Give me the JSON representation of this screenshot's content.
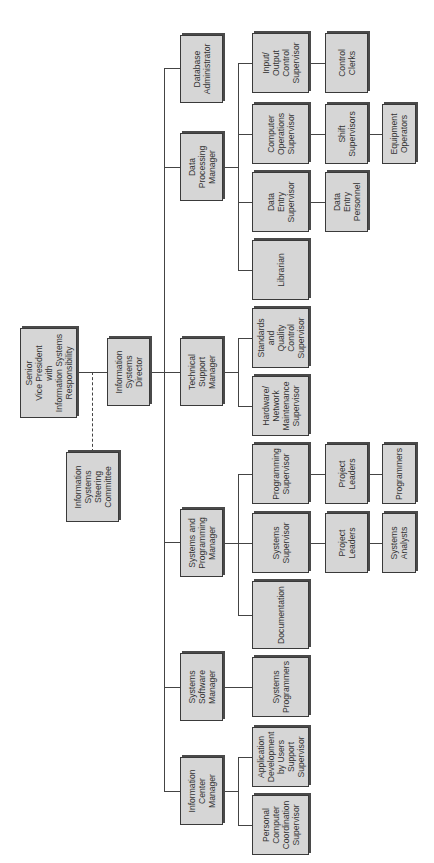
{
  "diagram": {
    "type": "org-chart",
    "orientation": "rotated-90-ccw",
    "colors": {
      "box_fill": "#d6d6d6",
      "box_border": "#3a3a3a",
      "shadow": "#4a4a4a",
      "line": "#444444"
    },
    "nodes": {
      "svp": "Senior\nVice President\nwith\nInformation Systems\nResponsibility",
      "steering": "Information\nSystems\nSteering\nCommittee",
      "director": "Information\nSystems\nDirector",
      "dba": "Database\nAdministrator",
      "dpm": "Data\nProcessing\nManager",
      "io_sup": "Input/\nOutput\nControl\nSupervisor",
      "control_clerks": "Control\nClerks",
      "comp_ops": "Computer\nOperations\nSupervisor",
      "shift_sup": "Shift\nSupervisors",
      "equip_ops": "Equipment\nOperators",
      "data_entry_sup": "Data\nEntry\nSupervisor",
      "data_entry_pers": "Data\nEntry\nPersonnel",
      "librarian": "Librarian",
      "tsm": "Technical\nSupport\nManager",
      "standards": "Standards\nand\nQuality\nControl\nSupervisor",
      "hardware": "Hardware/\nNetwork\nMaintenance\nSupervisor",
      "spm": "Systems and\nProgramming\nManager",
      "prog_sup": "Programming\nSupervisor",
      "proj_leaders_1": "Project\nLeaders",
      "programmers": "Programmers",
      "sys_sup": "Systems\nSupervisor",
      "proj_leaders_2": "Project\nLeaders",
      "sys_analysts": "Systems\nAnalysts",
      "documentation": "Documentation",
      "ssm": "Systems\nSoftware\nManager",
      "sys_programmers": "Systems\nProgrammers",
      "icm": "Information\nCenter\nManager",
      "app_dev": "Application\nDevelopment\nby Users\nSupport\nSupervisor",
      "pc_coord": "Personal\nComputer\nCoordination\nSupervisor"
    },
    "edges": [
      [
        "svp",
        "director"
      ],
      [
        "svp",
        "steering",
        "dashed"
      ],
      [
        "director",
        "dba"
      ],
      [
        "director",
        "dpm"
      ],
      [
        "director",
        "tsm"
      ],
      [
        "director",
        "spm"
      ],
      [
        "director",
        "ssm"
      ],
      [
        "director",
        "icm"
      ],
      [
        "dpm",
        "io_sup"
      ],
      [
        "dpm",
        "comp_ops"
      ],
      [
        "dpm",
        "data_entry_sup"
      ],
      [
        "dpm",
        "librarian"
      ],
      [
        "io_sup",
        "control_clerks"
      ],
      [
        "comp_ops",
        "shift_sup"
      ],
      [
        "shift_sup",
        "equip_ops"
      ],
      [
        "data_entry_sup",
        "data_entry_pers"
      ],
      [
        "tsm",
        "standards"
      ],
      [
        "tsm",
        "hardware"
      ],
      [
        "spm",
        "prog_sup"
      ],
      [
        "spm",
        "sys_sup"
      ],
      [
        "spm",
        "documentation"
      ],
      [
        "prog_sup",
        "proj_leaders_1"
      ],
      [
        "proj_leaders_1",
        "programmers"
      ],
      [
        "sys_sup",
        "proj_leaders_2"
      ],
      [
        "proj_leaders_2",
        "sys_analysts"
      ],
      [
        "ssm",
        "sys_programmers"
      ],
      [
        "icm",
        "app_dev"
      ],
      [
        "icm",
        "pc_coord"
      ]
    ]
  }
}
